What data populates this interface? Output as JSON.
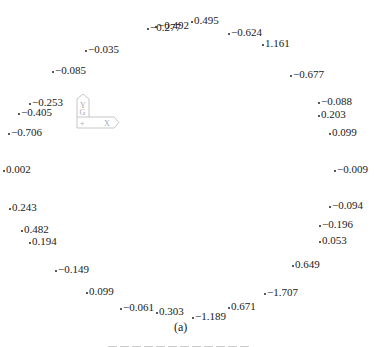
{
  "figure": {
    "label": "(a)",
    "axis_icon": {
      "y_label": "Y",
      "g_label": "G",
      "origin_mark": "+",
      "x_label": "X"
    },
    "points": [
      {
        "value": "-0.277",
        "x": 147,
        "y": 21
      },
      {
        "value": "-0.492",
        "x": 155,
        "y": 19
      },
      {
        "value": "0.495",
        "x": 191,
        "y": 14
      },
      {
        "value": "-0.624",
        "x": 228,
        "y": 26
      },
      {
        "value": "1.161",
        "x": 262,
        "y": 37
      },
      {
        "value": "-0.035",
        "x": 85,
        "y": 43
      },
      {
        "value": "-0.085",
        "x": 52,
        "y": 64
      },
      {
        "value": "-0.677",
        "x": 290,
        "y": 68
      },
      {
        "value": "-0.253",
        "x": 29,
        "y": 96
      },
      {
        "value": "-0.405",
        "x": 18,
        "y": 106
      },
      {
        "value": "-0.088",
        "x": 318,
        "y": 95
      },
      {
        "value": "0.203",
        "x": 318,
        "y": 108
      },
      {
        "value": "-0.706",
        "x": 8,
        "y": 126
      },
      {
        "value": "0.099",
        "x": 329,
        "y": 126
      },
      {
        "value": "0.002",
        "x": 3,
        "y": 163
      },
      {
        "value": "-0.009",
        "x": 334,
        "y": 163
      },
      {
        "value": "0.243",
        "x": 9,
        "y": 201
      },
      {
        "value": "-0.094",
        "x": 329,
        "y": 199
      },
      {
        "value": "0.482",
        "x": 21,
        "y": 223
      },
      {
        "value": "0.194",
        "x": 29,
        "y": 235
      },
      {
        "value": "-0.196",
        "x": 319,
        "y": 218
      },
      {
        "value": "0.053",
        "x": 319,
        "y": 234
      },
      {
        "value": "-0.149",
        "x": 55,
        "y": 263
      },
      {
        "value": "0.649",
        "x": 292,
        "y": 258
      },
      {
        "value": "0.099",
        "x": 86,
        "y": 285
      },
      {
        "value": "-1.707",
        "x": 264,
        "y": 286
      },
      {
        "value": "-0.061",
        "x": 120,
        "y": 301
      },
      {
        "value": "0.303",
        "x": 156,
        "y": 305
      },
      {
        "value": "0.671",
        "x": 228,
        "y": 300
      },
      {
        "value": "-1.189",
        "x": 192,
        "y": 310
      }
    ]
  }
}
